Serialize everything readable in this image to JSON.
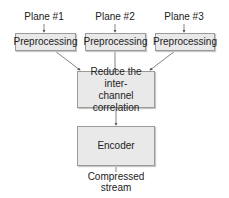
{
  "diagram": {
    "inputs": [
      {
        "label": "Plane #1"
      },
      {
        "label": "Plane #2"
      },
      {
        "label": "Plane #3"
      }
    ],
    "preprocessing": [
      {
        "label": "Preprocessing"
      },
      {
        "label": "Preprocessing"
      },
      {
        "label": "Preprocessing"
      }
    ],
    "reduce": {
      "label": "Reduce the inter-channel correlation",
      "line1": "Reduce the inter-",
      "line2": "channel correlation"
    },
    "encoder": {
      "label": "Encoder"
    },
    "output": {
      "line1": "Compressed",
      "line2": "stream"
    },
    "edges": [
      {
        "from": "Plane #1",
        "to": "Preprocessing 1"
      },
      {
        "from": "Plane #2",
        "to": "Preprocessing 2"
      },
      {
        "from": "Plane #3",
        "to": "Preprocessing 3"
      },
      {
        "from": "Preprocessing 1",
        "to": "Reduce the inter-channel correlation"
      },
      {
        "from": "Preprocessing 2",
        "to": "Reduce the inter-channel correlation"
      },
      {
        "from": "Preprocessing 3",
        "to": "Reduce the inter-channel correlation"
      },
      {
        "from": "Reduce the inter-channel correlation",
        "to": "Encoder"
      },
      {
        "from": "Encoder",
        "to": "Compressed stream"
      }
    ],
    "colors": {
      "box_fill": "#e9e9e9",
      "box_border": "#9a9a9a",
      "edge": "#555555"
    }
  }
}
